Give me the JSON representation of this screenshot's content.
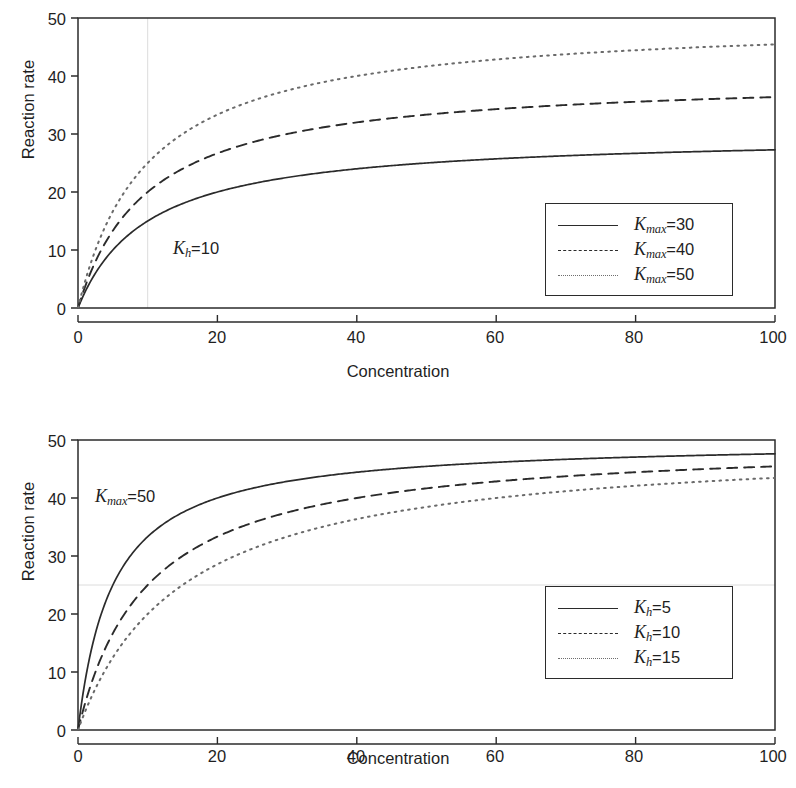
{
  "figure": {
    "background": "#ffffff",
    "ink_color": "#2b2b2b",
    "faint_grid_color": "#dcdcdc"
  },
  "panels": [
    {
      "id": "top",
      "ylabel": "Reaction rate",
      "xlabel": "Concentration",
      "yticks": [
        "0",
        "10",
        "20",
        "30",
        "40",
        "50"
      ],
      "xticks": [
        "0",
        "20",
        "40",
        "60",
        "80",
        "100"
      ],
      "annotation": {
        "symbol": "K",
        "subscript": "h",
        "equals": "=",
        "value": "10"
      },
      "legend": [
        {
          "style": "solid",
          "symbol": "K",
          "subscript": "max",
          "equals": "=",
          "value": "30"
        },
        {
          "style": "dashed",
          "symbol": "K",
          "subscript": "max",
          "equals": "=",
          "value": "40"
        },
        {
          "style": "dotted",
          "symbol": "K",
          "subscript": "max",
          "equals": "=",
          "value": "50"
        }
      ]
    },
    {
      "id": "bottom",
      "ylabel": "Reaction rate",
      "xlabel": "Concentration",
      "yticks": [
        "0",
        "10",
        "20",
        "30",
        "40",
        "50"
      ],
      "xticks": [
        "0",
        "20",
        "40",
        "60",
        "80",
        "100"
      ],
      "annotation": {
        "symbol": "K",
        "subscript": "max",
        "equals": "=",
        "value": "50"
      },
      "legend": [
        {
          "style": "solid",
          "symbol": "K",
          "subscript": "h",
          "equals": "=",
          "value": "5"
        },
        {
          "style": "dashed",
          "symbol": "K",
          "subscript": "h",
          "equals": "=",
          "value": "10"
        },
        {
          "style": "dotted",
          "symbol": "K",
          "subscript": "h",
          "equals": "=",
          "value": "15"
        }
      ]
    }
  ],
  "chart_data": [
    {
      "type": "line",
      "panel": "top",
      "title": "",
      "xlabel": "Concentration",
      "ylabel": "Reaction rate",
      "xlim": [
        0,
        100
      ],
      "ylim": [
        0,
        50
      ],
      "xticks": [
        0,
        20,
        40,
        60,
        80,
        100
      ],
      "yticks": [
        0,
        10,
        20,
        30,
        40,
        50
      ],
      "grid": "faint vertical reference line at x=10",
      "gridlines": {
        "vertical": [
          10
        ],
        "horizontal": []
      },
      "legend_position": "lower right inside axes",
      "annotations": [
        {
          "text": "K_h = 10",
          "x": 28,
          "y": 9.5
        }
      ],
      "model": "rate = Kmax * C / (Kh + C), Kh = 10",
      "x": [
        0,
        2,
        5,
        10,
        15,
        20,
        30,
        40,
        50,
        60,
        70,
        80,
        90,
        100
      ],
      "series": [
        {
          "name": "Kmax = 30",
          "style": "solid",
          "Kmax": 30,
          "Kh": 10,
          "values": [
            0,
            5.0,
            10.0,
            15.0,
            18.0,
            20.0,
            22.5,
            24.0,
            25.0,
            25.7,
            26.3,
            26.7,
            27.0,
            27.3
          ]
        },
        {
          "name": "Kmax = 40",
          "style": "dashed",
          "Kmax": 40,
          "Kh": 10,
          "values": [
            0,
            6.7,
            13.3,
            20.0,
            24.0,
            26.7,
            30.0,
            32.0,
            33.3,
            34.3,
            35.0,
            35.6,
            36.0,
            36.4
          ]
        },
        {
          "name": "Kmax = 50",
          "style": "dotted",
          "Kmax": 50,
          "Kh": 10,
          "values": [
            0,
            8.3,
            16.7,
            25.0,
            30.0,
            33.3,
            37.5,
            40.0,
            41.7,
            42.9,
            43.8,
            44.4,
            45.0,
            45.5
          ]
        }
      ]
    },
    {
      "type": "line",
      "panel": "bottom",
      "title": "",
      "xlabel": "Concentration",
      "ylabel": "Reaction rate",
      "xlim": [
        0,
        100
      ],
      "ylim": [
        0,
        50
      ],
      "xticks": [
        0,
        20,
        40,
        60,
        80,
        100
      ],
      "yticks": [
        0,
        10,
        20,
        30,
        40,
        50
      ],
      "grid": "faint horizontal reference line at y=25",
      "gridlines": {
        "vertical": [],
        "horizontal": [
          25
        ]
      },
      "legend_position": "lower right inside axes",
      "annotations": [
        {
          "text": "K_max = 50",
          "x": 5,
          "y": 40
        }
      ],
      "model": "rate = Kmax * C / (Kh + C), Kmax = 50",
      "x": [
        0,
        2,
        5,
        10,
        15,
        20,
        30,
        40,
        50,
        60,
        70,
        80,
        90,
        100
      ],
      "series": [
        {
          "name": "Kh = 5",
          "style": "solid",
          "Kmax": 50,
          "Kh": 5,
          "values": [
            0,
            14.3,
            25.0,
            33.3,
            37.5,
            40.0,
            42.9,
            44.4,
            45.5,
            46.2,
            46.7,
            47.1,
            47.4,
            47.6
          ]
        },
        {
          "name": "Kh = 10",
          "style": "dashed",
          "Kmax": 50,
          "Kh": 10,
          "values": [
            0,
            8.3,
            16.7,
            25.0,
            30.0,
            33.3,
            37.5,
            40.0,
            41.7,
            42.9,
            43.8,
            44.4,
            45.0,
            45.5
          ]
        },
        {
          "name": "Kh = 15",
          "style": "dotted",
          "Kmax": 50,
          "Kh": 15,
          "values": [
            0,
            5.9,
            12.5,
            20.0,
            25.0,
            28.6,
            33.3,
            36.4,
            38.5,
            40.0,
            41.2,
            42.1,
            42.9,
            43.5
          ]
        }
      ]
    }
  ]
}
